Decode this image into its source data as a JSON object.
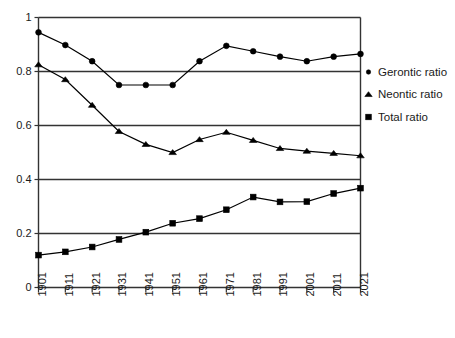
{
  "chart_data": {
    "type": "line",
    "title": "",
    "subtitle": "",
    "xlabel": "",
    "ylabel": "",
    "categories": [
      "1901",
      "1911",
      "1921",
      "1931",
      "1941",
      "1951",
      "1961",
      "1971",
      "1981",
      "1991",
      "2001",
      "2011",
      "2021"
    ],
    "x": [
      1901,
      1911,
      1921,
      1931,
      1941,
      1951,
      1961,
      1971,
      1981,
      1991,
      2001,
      2011,
      2021
    ],
    "series": [
      {
        "name": "Gerontic ratio",
        "marker": "circle",
        "values": [
          0.945,
          0.898,
          0.838,
          0.75,
          0.75,
          0.75,
          0.838,
          0.895,
          0.875,
          0.855,
          0.838,
          0.855,
          0.865
        ]
      },
      {
        "name": "Neontic ratio",
        "marker": "triangle",
        "values": [
          0.825,
          0.77,
          0.675,
          0.578,
          0.53,
          0.5,
          0.548,
          0.575,
          0.545,
          0.515,
          0.505,
          0.497,
          0.488
        ]
      },
      {
        "name": "Total ratio",
        "marker": "square",
        "values": [
          0.12,
          0.132,
          0.15,
          0.178,
          0.205,
          0.238,
          0.255,
          0.288,
          0.335,
          0.317,
          0.318,
          0.348,
          0.368
        ]
      }
    ],
    "ylim": [
      0,
      1
    ],
    "yticks": [
      0,
      0.2,
      0.4,
      0.6,
      0.8,
      1
    ],
    "ytick_labels": [
      "0",
      "0.2",
      "0.4",
      "0.6",
      "0.8",
      "1"
    ],
    "grid": true,
    "grid_axis": "y",
    "legend_position": "right",
    "legend": [
      {
        "label": "Gerontic ratio",
        "marker": "circle"
      },
      {
        "label": "Neontic ratio",
        "marker": "triangle"
      },
      {
        "label": "Total ratio",
        "marker": "square"
      }
    ],
    "colors": {
      "series": "#000000",
      "axis": "#333333",
      "grid": "#333333",
      "background": "#ffffff"
    }
  }
}
